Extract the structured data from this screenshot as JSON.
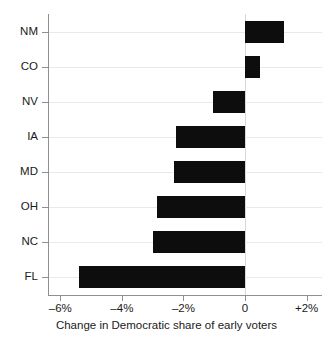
{
  "chart_data": {
    "type": "bar",
    "orientation": "horizontal",
    "title": "",
    "xlabel": "Change in Democratic share of early voters",
    "ylabel": "",
    "categories": [
      "NM",
      "CO",
      "NV",
      "IA",
      "MD",
      "OH",
      "NC",
      "FL"
    ],
    "values": [
      1.25,
      0.5,
      -1.05,
      -2.25,
      -2.3,
      -2.85,
      -3.0,
      -5.4
    ],
    "xlim": [
      -6.4,
      2.5
    ],
    "ylim": null,
    "xticks": [
      -6,
      -4,
      -2,
      0,
      2
    ],
    "xtick_labels": [
      "–6%",
      "–4%",
      "–2%",
      "0",
      "+2%"
    ],
    "ytick_labels": [
      "NM",
      "CO",
      "NV",
      "IA",
      "MD",
      "OH",
      "NC",
      "FL"
    ],
    "grid": "horizontal",
    "legend": null,
    "bar_color": "#0d0d0d",
    "grid_color": "#e9e9e9",
    "axis_color": "#8f8f8f",
    "zero_line_color": "#d8d8d8",
    "background": "#ffffff"
  }
}
